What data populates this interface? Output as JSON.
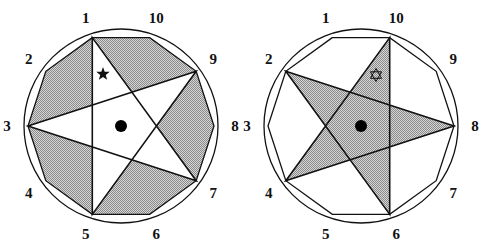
{
  "figures": [
    {
      "id": "left",
      "center": [
        121,
        126
      ],
      "radius": 93,
      "pentagram_vertices": [
        1,
        3,
        5,
        7,
        9
      ],
      "shaded_region": "decagon-outside-star",
      "marker": "filled-star",
      "labels": [
        "1",
        "2",
        "3",
        "4",
        "5",
        "6",
        "7",
        "8",
        "9",
        "10"
      ]
    },
    {
      "id": "right",
      "center": [
        361,
        126
      ],
      "radius": 93,
      "pentagram_vertices": [
        2,
        4,
        6,
        8,
        10
      ],
      "shaded_region": "star",
      "marker": "hexagram-outline",
      "labels": [
        "1",
        "2",
        "3",
        "4",
        "5",
        "6",
        "7",
        "8",
        "9",
        "10"
      ]
    }
  ],
  "colors": {
    "stroke": "#111111",
    "shade_dark": "#7a7a7a",
    "shade_light": "#d8d8d8",
    "background": "#ffffff"
  }
}
